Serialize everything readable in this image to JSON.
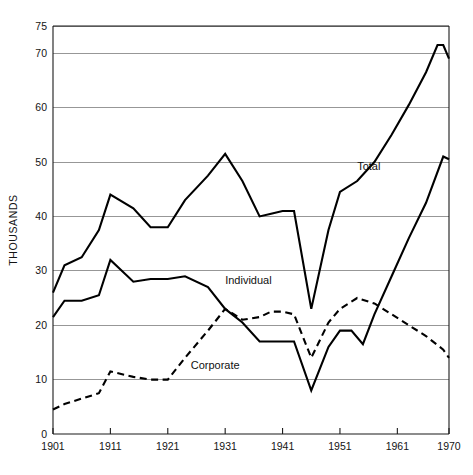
{
  "chart_data": {
    "type": "line",
    "title": "",
    "xlabel": "",
    "ylabel": "THOUSANDS",
    "xlim": [
      1901,
      1970
    ],
    "ylim": [
      0,
      75
    ],
    "grid": true,
    "grid_values": [
      0,
      10,
      20,
      30,
      40,
      50,
      60,
      70,
      75
    ],
    "legend_position": "inline-annotations",
    "x_tick_labels": [
      "1901",
      "1911",
      "1921",
      "1931",
      "1941",
      "1951",
      "1961",
      "1970"
    ],
    "x_tick_values": [
      1901,
      1911,
      1921,
      1931,
      1941,
      1951,
      1961,
      1970
    ],
    "y_tick_labels": [
      "0",
      "10",
      "20",
      "30",
      "40",
      "50",
      "60",
      "70",
      "75"
    ],
    "y_tick_values": [
      0,
      10,
      20,
      30,
      40,
      50,
      60,
      70,
      75
    ],
    "series": [
      {
        "name": "Total",
        "style": "solid",
        "label_x": 1954,
        "label_y": 48.5,
        "x": [
          1901,
          1903,
          1906,
          1909,
          1911,
          1915,
          1918,
          1921,
          1924,
          1928,
          1931,
          1934,
          1937,
          1939,
          1941,
          1943,
          1946,
          1949,
          1951,
          1954,
          1957,
          1960,
          1963,
          1966,
          1968,
          1969,
          1970
        ],
        "values": [
          26.0,
          31.0,
          32.5,
          37.5,
          44.0,
          41.5,
          38.0,
          38.0,
          43.0,
          47.5,
          51.5,
          46.5,
          40.0,
          40.5,
          41.0,
          41.0,
          23.0,
          37.5,
          44.5,
          46.5,
          50.0,
          55.0,
          60.5,
          66.5,
          71.5,
          71.5,
          69.0
        ]
      },
      {
        "name": "Individual",
        "style": "dashed",
        "label_x": 1931,
        "label_y": 27.5,
        "x": [
          1901,
          1903,
          1906,
          1909,
          1911,
          1915,
          1918,
          1921,
          1924,
          1928,
          1931,
          1934,
          1937,
          1939,
          1941,
          1943,
          1946,
          1949,
          1951,
          1954,
          1957,
          1960,
          1963,
          1966,
          1969,
          1970
        ],
        "values": [
          4.5,
          5.5,
          6.5,
          7.5,
          11.5,
          10.5,
          10.0,
          10.0,
          14.0,
          19.0,
          23.0,
          21.0,
          21.5,
          22.5,
          22.5,
          22.0,
          14.0,
          20.5,
          23.0,
          25.0,
          24.0,
          22.0,
          20.0,
          18.0,
          15.5,
          14.0
        ]
      },
      {
        "name": "Corporate",
        "style": "solid",
        "label_x": 1925,
        "label_y": 12.0,
        "x": [
          1901,
          1903,
          1906,
          1909,
          1911,
          1915,
          1918,
          1921,
          1924,
          1928,
          1931,
          1934,
          1937,
          1939,
          1941,
          1943,
          1946,
          1949,
          1951,
          1953,
          1955,
          1957,
          1960,
          1963,
          1966,
          1969,
          1970
        ],
        "values": [
          21.5,
          24.5,
          24.5,
          25.5,
          32.0,
          28.0,
          28.5,
          28.5,
          29.0,
          27.0,
          23.0,
          20.5,
          17.0,
          17.0,
          17.0,
          17.0,
          8.0,
          16.0,
          19.0,
          19.0,
          16.5,
          22.0,
          29.0,
          36.0,
          42.5,
          51.0,
          50.5
        ]
      }
    ]
  },
  "geometry": {
    "plot_left": 53,
    "plot_right": 449,
    "plot_top": 26,
    "plot_bottom": 434
  }
}
